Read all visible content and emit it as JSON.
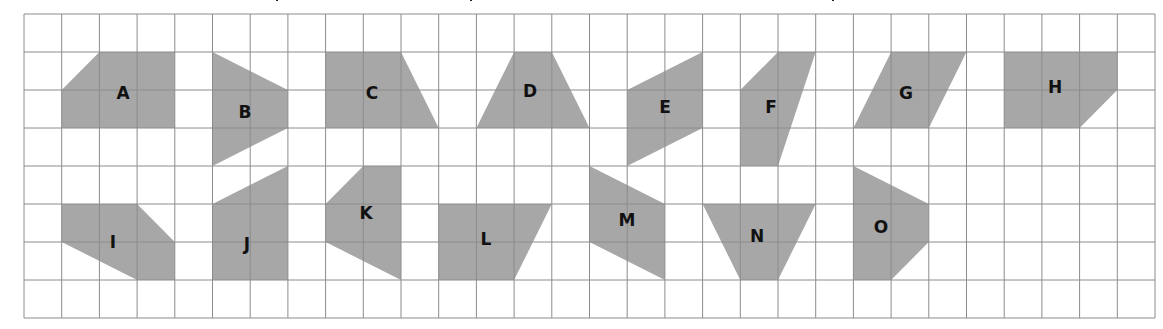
{
  "figure": {
    "grid": {
      "origin_px": [
        24,
        14
      ],
      "cell_width_px": 37.7,
      "cell_height_px": 38,
      "columns": 30,
      "rows": 8,
      "line_color": "#8c8c8c",
      "background": "#ffffff"
    },
    "shape_fill": "#a7a7a7",
    "label_color": "#111111",
    "cropped_caption_fragments_x": [
      276,
      470,
      832
    ]
  },
  "shapes": [
    {
      "label": "A",
      "points": [
        [
          1,
          2
        ],
        [
          2,
          1
        ],
        [
          4,
          1
        ],
        [
          4,
          3
        ],
        [
          1,
          3
        ]
      ],
      "label_pos": [
        123,
        93
      ]
    },
    {
      "label": "B",
      "points": [
        [
          5,
          1
        ],
        [
          7,
          2
        ],
        [
          7,
          3
        ],
        [
          5,
          4
        ]
      ],
      "label_pos": [
        245,
        112
      ]
    },
    {
      "label": "C",
      "points": [
        [
          8,
          1
        ],
        [
          10,
          1
        ],
        [
          11,
          3
        ],
        [
          8,
          3
        ]
      ],
      "label_pos": [
        372,
        93
      ]
    },
    {
      "label": "D",
      "points": [
        [
          13,
          1
        ],
        [
          14,
          1
        ],
        [
          15,
          3
        ],
        [
          12,
          3
        ]
      ],
      "label_pos": [
        530,
        91
      ]
    },
    {
      "label": "E",
      "points": [
        [
          16,
          2
        ],
        [
          18,
          1
        ],
        [
          18,
          3
        ],
        [
          16,
          4
        ]
      ],
      "label_pos": [
        665,
        107
      ]
    },
    {
      "label": "F",
      "points": [
        [
          19,
          2
        ],
        [
          20,
          1
        ],
        [
          21,
          1
        ],
        [
          20,
          4
        ],
        [
          19,
          4
        ]
      ],
      "label_pos": [
        771,
        107
      ]
    },
    {
      "label": "G",
      "points": [
        [
          23,
          1
        ],
        [
          25,
          1
        ],
        [
          24,
          3
        ],
        [
          22,
          3
        ]
      ],
      "label_pos": [
        906,
        93
      ]
    },
    {
      "label": "H",
      "points": [
        [
          26,
          1
        ],
        [
          29,
          1
        ],
        [
          29,
          2
        ],
        [
          28,
          3
        ],
        [
          26,
          3
        ]
      ],
      "label_pos": [
        1055,
        87
      ]
    },
    {
      "label": "I",
      "points": [
        [
          1,
          5
        ],
        [
          3,
          5
        ],
        [
          4,
          6
        ],
        [
          4,
          7
        ],
        [
          3,
          7
        ],
        [
          1,
          6
        ]
      ],
      "label_pos": [
        113,
        242
      ]
    },
    {
      "label": "J",
      "points": [
        [
          5,
          5
        ],
        [
          7,
          4
        ],
        [
          7,
          7
        ],
        [
          5,
          7
        ]
      ],
      "label_pos": [
        247,
        244
      ]
    },
    {
      "label": "K",
      "points": [
        [
          9,
          4
        ],
        [
          10,
          4
        ],
        [
          10,
          7
        ],
        [
          8,
          6
        ],
        [
          8,
          5
        ]
      ],
      "label_pos": [
        366,
        213
      ]
    },
    {
      "label": "L",
      "points": [
        [
          11,
          5
        ],
        [
          14,
          5
        ],
        [
          13,
          7
        ],
        [
          11,
          7
        ]
      ],
      "label_pos": [
        486,
        239
      ]
    },
    {
      "label": "M",
      "points": [
        [
          15,
          4
        ],
        [
          17,
          5
        ],
        [
          17,
          7
        ],
        [
          15,
          6
        ]
      ],
      "label_pos": [
        627,
        220
      ]
    },
    {
      "label": "N",
      "points": [
        [
          18,
          5
        ],
        [
          21,
          5
        ],
        [
          20,
          7
        ],
        [
          19,
          7
        ]
      ],
      "label_pos": [
        757,
        236
      ]
    },
    {
      "label": "O",
      "points": [
        [
          22,
          4
        ],
        [
          24,
          5
        ],
        [
          24,
          6
        ],
        [
          23,
          7
        ],
        [
          22,
          7
        ]
      ],
      "label_pos": [
        881,
        227
      ]
    }
  ]
}
